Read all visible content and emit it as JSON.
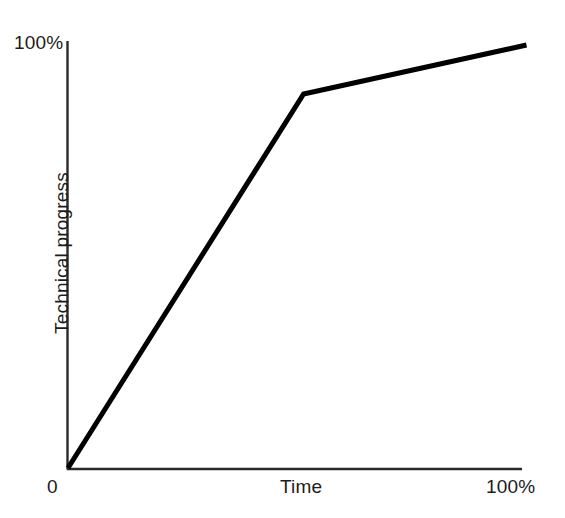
{
  "chart_data": {
    "type": "line",
    "title": "",
    "subtitle": "",
    "xlabel": "Time",
    "ylabel": "Technical progress",
    "xlim": [
      0,
      100
    ],
    "ylim": [
      0,
      100
    ],
    "grid": false,
    "legend": null,
    "x_tick_labels": [
      "0",
      "100%"
    ],
    "y_tick_labels": [
      "0",
      "100%"
    ],
    "x_axis_title_position": "center",
    "annotations": [],
    "series": [
      {
        "name": "Technical progress over time",
        "style": "solid",
        "color": "#000000",
        "line_width_px": 5,
        "x": [
          0,
          51.9,
          101.0
        ],
        "y": [
          0,
          87.8,
          99.3
        ],
        "points": [
          {
            "x": 0,
            "y": 0,
            "note": "origin start"
          },
          {
            "x": 51.9,
            "y": 87.8,
            "note": "kink / inflection point where growth slows"
          },
          {
            "x": 101.0,
            "y": 99.3,
            "note": "end point near 100% progress"
          }
        ]
      }
    ]
  },
  "labels": {
    "y_max": "100%",
    "origin": "0",
    "x_title": "Time",
    "x_max": "100%",
    "y_title": "Technical progress"
  },
  "colors": {
    "background": "#ffffff",
    "axis": "#2a2a2a",
    "curve": "#000000",
    "text": "#1c1c1c"
  }
}
